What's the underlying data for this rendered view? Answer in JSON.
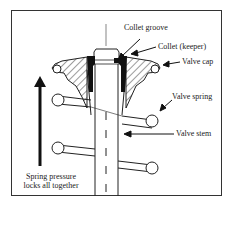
{
  "labels": {
    "collet_groove": "Collet groove",
    "collet_keeper": "Collet (keeper)",
    "valve_cap": "Valve cap",
    "valve_spring": "Valve spring",
    "valve_stem": "Valve stem"
  },
  "caption": {
    "line1": "Spring pressure",
    "line2": "locks all together"
  }
}
